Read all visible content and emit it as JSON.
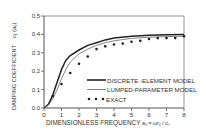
{
  "chart_data": {
    "type": "line",
    "title": "",
    "xlabel": "DIMENSIONLESS FREQUENCY  a0 = ωr0 / cs",
    "ylabel": "DAMPING COEFFICIENT  c1 (a0)",
    "xlim": [
      0,
      8
    ],
    "ylim": [
      0,
      0.5
    ],
    "xticks": [
      "0",
      "1",
      "2",
      "3",
      "4",
      "5",
      "6",
      "7",
      "8"
    ],
    "yticks": [
      "0.0",
      "0.1",
      "0.2",
      "0.3",
      "0.4",
      "0.5"
    ],
    "grid": false,
    "legend_position": "lower right inside",
    "series": [
      {
        "name": "DISCRETE - ELEMENT MODEL",
        "style": "thick solid line",
        "x": [
          0,
          0.25,
          0.5,
          0.75,
          1.0,
          1.25,
          1.5,
          2.0,
          2.5,
          3.0,
          3.5,
          4.0,
          5.0,
          6.0,
          7.0,
          8.0
        ],
        "y": [
          0,
          0.02,
          0.07,
          0.14,
          0.21,
          0.26,
          0.285,
          0.315,
          0.34,
          0.355,
          0.37,
          0.38,
          0.39,
          0.395,
          0.398,
          0.4
        ]
      },
      {
        "name": "LUMPED - PARAMETER MODEL",
        "style": "thin solid line",
        "x": [
          0,
          0.25,
          0.5,
          0.75,
          1.0,
          1.25,
          1.5,
          2.0,
          2.5,
          3.0,
          3.5,
          4.0,
          5.0,
          6.0,
          7.0,
          8.0
        ],
        "y": [
          0,
          0.015,
          0.05,
          0.1,
          0.16,
          0.21,
          0.25,
          0.295,
          0.32,
          0.34,
          0.355,
          0.365,
          0.378,
          0.385,
          0.388,
          0.39
        ]
      },
      {
        "name": "EXACT",
        "style": "dots",
        "x": [
          0.5,
          1.0,
          1.5,
          2.0,
          2.5,
          3.0,
          3.5,
          4.0,
          4.5,
          5.0,
          5.5,
          6.0,
          6.5,
          7.0,
          7.5,
          8.0
        ],
        "y": [
          0.065,
          0.13,
          0.19,
          0.24,
          0.28,
          0.32,
          0.335,
          0.345,
          0.35,
          0.36,
          0.365,
          0.375,
          0.38,
          0.38,
          0.38,
          0.39
        ]
      }
    ]
  },
  "axes": {
    "ylabel_main": "DAMPING COEFFICIENT",
    "ylabel_symbol": "c₁ (a₀)",
    "xlabel_main": "DIMENSIONLESS FREQUENCY",
    "xlabel_symbol": "a₀ = ωr₀ / cₛ"
  },
  "legend": {
    "items": [
      {
        "label": "DISCRETE -ELEMENT MODEL"
      },
      {
        "label": "LUMPED-PARAMETER  MODEL"
      },
      {
        "label": "EXACT"
      }
    ]
  },
  "colors": {
    "line": "#222222",
    "axis": "#555555",
    "background": "#ffffff"
  }
}
